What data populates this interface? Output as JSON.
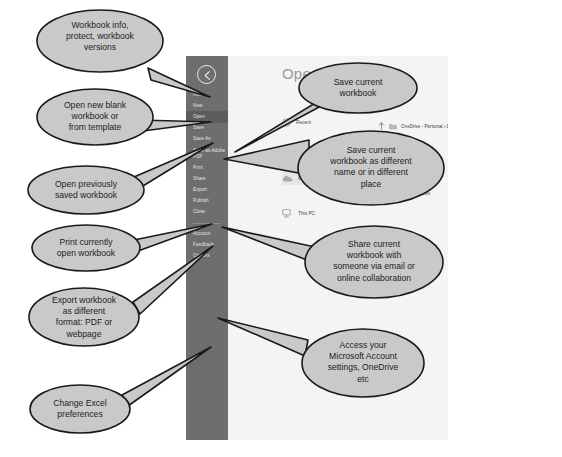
{
  "app": {
    "screen_title": "Open",
    "back_button": "back-arrow"
  },
  "sidebar": {
    "items": [
      {
        "label": "Info",
        "selected": false
      },
      {
        "label": "New",
        "selected": false
      },
      {
        "label": "Open",
        "selected": true
      },
      {
        "label": "Save",
        "selected": false
      },
      {
        "label": "Save As",
        "selected": false
      },
      {
        "label": "Save as Adobe PDF",
        "selected": false
      },
      {
        "label": "Print",
        "selected": false
      },
      {
        "label": "Share",
        "selected": false
      },
      {
        "label": "Export",
        "selected": false
      },
      {
        "label": "Publish",
        "selected": false
      },
      {
        "label": "Close",
        "selected": false
      }
    ],
    "bottom_items": [
      {
        "label": "Account"
      },
      {
        "label": "Feedback"
      },
      {
        "label": "Options"
      }
    ]
  },
  "open_pane": {
    "title": "Open",
    "places": [
      {
        "label": "Recent",
        "icon": "clock-icon",
        "highlighted": false
      },
      {
        "label": "OneDrive - Personal",
        "icon": "cloud-icon",
        "highlighted": true
      },
      {
        "label": "This PC",
        "icon": "monitor-icon",
        "highlighted": false
      }
    ],
    "breadcrumb": "OneDrive - Personal  ›  Documents",
    "up_icon": "up-arrow-icon",
    "folder_icon": "folder-icon",
    "ellipsis": "...",
    "files": [
      {
        "name": "Work",
        "icon": "folder-icon"
      },
      {
        "name": "Excel Final.xlsx",
        "icon": "excel-file-icon"
      }
    ]
  },
  "callouts": [
    {
      "id": "info",
      "text": "Workbook info,\nprotect, workbook\nversions"
    },
    {
      "id": "new",
      "text": "Open new blank\nworkbook or\nfrom template"
    },
    {
      "id": "open",
      "text": "Open previously\nsaved workbook"
    },
    {
      "id": "print",
      "text": "Print currently\nopen workbook"
    },
    {
      "id": "export",
      "text": "Export workbook\nas different\nformat: PDF or\nwebpage"
    },
    {
      "id": "options",
      "text": "Change Excel\npreferences"
    },
    {
      "id": "save",
      "text": "Save current\nworkbook"
    },
    {
      "id": "saveas",
      "text": "Save current\nworkbook as different\nname or in different\nplace"
    },
    {
      "id": "share",
      "text": "Share current\nworkbook with\nsomeone via email or\nonline collaboration"
    },
    {
      "id": "account",
      "text": "Access your\nMicrosoft Account\nsettings, OneDrive\netc"
    }
  ],
  "colors": {
    "callout_fill": "#c9c9c9",
    "callout_stroke": "#1a1a1a",
    "backstage_bar": "#6e6e6e",
    "backstage_selected": "#5d5d5d",
    "pane_bg": "#f4f4f4"
  }
}
